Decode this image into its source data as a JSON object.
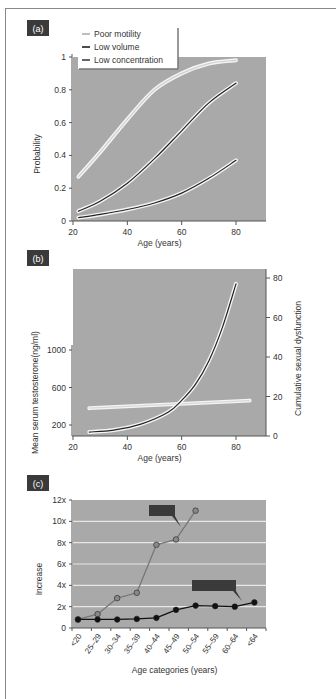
{
  "panels": [
    {
      "label": "(a)"
    },
    {
      "label": "(b)"
    },
    {
      "label": "(c)"
    }
  ],
  "colors": {
    "plot_bg": "#a9a9a9",
    "label_bg": "#3a3a3a",
    "grid": "#e6e6e6",
    "series_gray": "#888888",
    "series_black": "#222222"
  },
  "chart_data": [
    {
      "type": "line",
      "panel": "(a)",
      "title": "",
      "xlabel": "Age (years)",
      "ylabel": "Probability",
      "xlim": [
        20,
        90
      ],
      "ylim": [
        0,
        1
      ],
      "xticks": [
        20,
        40,
        60,
        80
      ],
      "yticks": [
        0,
        0.2,
        0.4,
        0.6,
        0.8,
        1
      ],
      "ytick_labels": [
        "0",
        "0.2",
        "0.4",
        "0.6",
        "0.8",
        "1"
      ],
      "legend": [
        "Poor motility",
        "Low volume",
        "Low concentration"
      ],
      "legend_position": "top-left",
      "x": [
        22,
        30,
        40,
        50,
        60,
        70,
        80
      ],
      "series": [
        {
          "name": "Poor motility",
          "values": [
            0.27,
            0.42,
            0.62,
            0.8,
            0.9,
            0.96,
            0.98
          ]
        },
        {
          "name": "Low volume",
          "values": [
            0.06,
            0.12,
            0.23,
            0.38,
            0.55,
            0.72,
            0.84
          ]
        },
        {
          "name": "Low concentration",
          "values": [
            0.02,
            0.04,
            0.07,
            0.11,
            0.17,
            0.26,
            0.37
          ]
        }
      ]
    },
    {
      "type": "line",
      "panel": "(b)",
      "xlabel": "Age (years)",
      "ylabel": "Mean serum testosterone(ng/ml)",
      "ylabel_right": "Cumulative sexual dysfunction",
      "xlim": [
        20,
        90
      ],
      "xticks": [
        20,
        40,
        60,
        80
      ],
      "yticks_left": [
        200,
        600,
        1000
      ],
      "yticks_right": [
        0,
        20,
        40,
        60,
        80
      ],
      "ylim_right": [
        0,
        85
      ],
      "series": [
        {
          "name": "Mean serum testosterone",
          "axis": "left",
          "x": [
            26,
            85
          ],
          "values": [
            380,
            460
          ]
        },
        {
          "name": "Cumulative sexual dysfunction",
          "axis": "right",
          "x": [
            26,
            35,
            45,
            55,
            60,
            65,
            70,
            75,
            80
          ],
          "values": [
            2,
            3,
            6,
            12,
            18,
            26,
            38,
            55,
            77
          ]
        }
      ]
    },
    {
      "type": "line",
      "panel": "(c)",
      "xlabel": "Age categories (years)",
      "ylabel": "Increase",
      "ylim": [
        0,
        12
      ],
      "yticks": [
        "0",
        "2x",
        "4x",
        "6x",
        "8x",
        "10x",
        "12x"
      ],
      "grid": true,
      "categories": [
        "<20",
        "25–29",
        "30–34",
        "35–39",
        "40–44",
        "45–49",
        "50–54",
        "55–59",
        "60–64",
        "<64"
      ],
      "series": [
        {
          "name": "gray series",
          "values": [
            0.8,
            1.3,
            2.8,
            3.3,
            7.8,
            8.3,
            11.0,
            null,
            null,
            null
          ]
        },
        {
          "name": "black series",
          "values": [
            0.8,
            0.8,
            0.8,
            0.85,
            0.95,
            1.7,
            2.1,
            2.05,
            2.0,
            2.4
          ]
        }
      ]
    }
  ]
}
